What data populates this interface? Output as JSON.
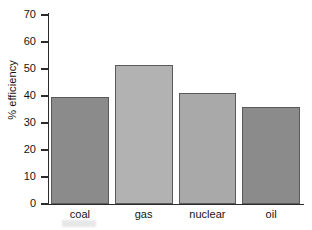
{
  "chart_data": {
    "type": "bar",
    "title": "",
    "xlabel": "",
    "ylabel": "% efficiency",
    "categories": [
      "coal",
      "gas",
      "nuclear",
      "oil"
    ],
    "values": [
      39.5,
      51.5,
      41,
      36
    ],
    "ylim": [
      0,
      70
    ],
    "yticks": [
      0,
      10,
      20,
      30,
      40,
      50,
      60,
      70
    ],
    "ytick_labels": [
      "0",
      "10",
      "20",
      "30",
      "40",
      "50",
      "60",
      "70"
    ],
    "grid": false,
    "legend": null,
    "bar_colors": [
      "#8b8b8b",
      "#b2b2b2",
      "#a9a9a9",
      "#8b8b8b"
    ],
    "bar_edge_color": "#5a5a5a",
    "axis_color": "#2b2b2b",
    "background": "#ffffff"
  }
}
